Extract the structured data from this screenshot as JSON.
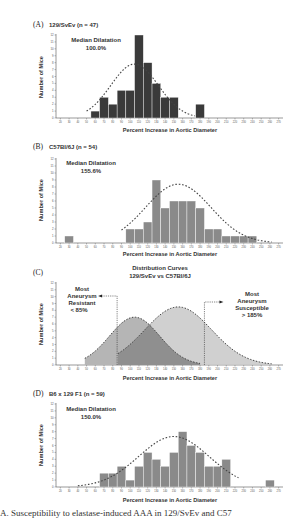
{
  "figure": {
    "x_ticks": [
      20,
      30,
      40,
      50,
      60,
      70,
      80,
      90,
      100,
      110,
      120,
      130,
      140,
      150,
      160,
      170,
      180,
      190,
      200,
      210,
      220,
      230,
      240,
      250,
      260,
      270
    ],
    "y_ticks": [
      0,
      1,
      2,
      3,
      4,
      5,
      6,
      7,
      8,
      9,
      10,
      11,
      12
    ],
    "caption": "A. Susceptibility to elastase-induced AAA in 129/SvEv and C57"
  },
  "panels": [
    {
      "label": "(A)",
      "title": "129/SvEv (n = 47)",
      "annotation_line1": "Median Dilatation",
      "annotation_line2": "100.0%",
      "xlabel": "Percent Increase in Aortic Diameter",
      "ylabel": "Number of Mice"
    },
    {
      "label": "(B)",
      "title": "C57Bl/6J (n = 54)",
      "annotation_line1": "Median Dilatation",
      "annotation_line2": "155.6%",
      "xlabel": "Percent Increase in Aortic Diameter",
      "ylabel": "Number of Mice"
    },
    {
      "label": "(C)",
      "title_line1": "Distribution Curves",
      "title_line2": "129/SvEv vs C57Bl/6J",
      "left_note": [
        "Most",
        "Aneurysm",
        "Resistant",
        "< 85%"
      ],
      "right_note": [
        "Most",
        "Aneurysm",
        "Susceptible",
        "> 185%"
      ],
      "xlabel": "Percent Increase in Aortic Diameter",
      "ylabel": "Number of Mice"
    },
    {
      "label": "(D)",
      "title": "B6 x 129 F1 (n = 59)",
      "annotation_line1": "Median Dilatation",
      "annotation_line2": "150.0%",
      "xlabel": "Percent Increase in Aortic Diameter",
      "ylabel": "Number of Mice"
    }
  ],
  "colors": {
    "bar_dark": "#3a3a3a",
    "bar_gray": "#8a8a8a",
    "curve_129": "#b5b5b5",
    "curve_b6": "#c8c8c8",
    "overlap": "#8f8f8f",
    "dashed": "#444444"
  },
  "chart_data": [
    {
      "type": "bar",
      "title": "(A) 129/SvEv (n = 47)",
      "annotation": "Median Dilatation 100.0%",
      "xlabel": "Percent Increase in Aortic Diameter",
      "ylabel": "Number of Mice",
      "ylim": [
        0,
        12
      ],
      "xlim": [
        20,
        270
      ],
      "categories": [
        60,
        70,
        80,
        90,
        100,
        110,
        120,
        130,
        140,
        150,
        180
      ],
      "values": [
        1,
        3,
        2,
        4,
        4,
        12,
        8,
        5,
        3,
        3,
        2
      ],
      "fit_curve": {
        "type": "normal",
        "peak_x": 105,
        "peak_y": 7.8,
        "x_range": [
          50,
          175
        ]
      }
    },
    {
      "type": "bar",
      "title": "(B) C57Bl/6J (n = 54)",
      "annotation": "Median Dilatation 155.6%",
      "xlabel": "Percent Increase in Aortic Diameter",
      "ylabel": "Number of Mice",
      "ylim": [
        0,
        12
      ],
      "xlim": [
        20,
        270
      ],
      "categories": [
        30,
        100,
        110,
        120,
        130,
        140,
        150,
        160,
        170,
        180,
        190,
        200,
        210,
        220,
        230,
        240
      ],
      "values": [
        1,
        2,
        2,
        3,
        9,
        5,
        6,
        6,
        6,
        5,
        2,
        2,
        1,
        1,
        1,
        1
      ],
      "fit_curve": {
        "type": "normal",
        "peak_x": 155,
        "peak_y": 8.4,
        "x_range": [
          90,
          262
        ]
      }
    },
    {
      "type": "area",
      "title": "(C) Distribution Curves 129/SvEv vs C57Bl/6J",
      "xlabel": "Percent Increase in Aortic Diameter",
      "ylabel": "Number of Mice",
      "ylim": [
        0,
        12
      ],
      "xlim": [
        20,
        270
      ],
      "series": [
        {
          "name": "129/SvEv",
          "peak_x": 105,
          "peak_y": 7.0,
          "x_range": [
            48,
            180
          ]
        },
        {
          "name": "C57Bl/6J",
          "peak_x": 155,
          "peak_y": 8.5,
          "x_range": [
            86,
            262
          ]
        }
      ],
      "annotations": [
        {
          "text": "Most Aneurysm Resistant < 85%",
          "x": 85
        },
        {
          "text": "Most Aneurysm Susceptible > 185%",
          "x": 185
        }
      ]
    },
    {
      "type": "bar",
      "title": "(D) B6 x 129 F1 (n = 59)",
      "annotation": "Median Dilatation 150.0%",
      "xlabel": "Percent Increase in Aortic Diameter",
      "ylabel": "Number of Mice",
      "ylim": [
        0,
        12
      ],
      "xlim": [
        20,
        270
      ],
      "categories": [
        70,
        80,
        90,
        100,
        110,
        120,
        130,
        140,
        150,
        160,
        170,
        180,
        190,
        200,
        210,
        260
      ],
      "values": [
        2,
        2,
        3,
        1,
        3,
        5,
        4,
        3,
        5,
        8,
        6,
        5,
        3,
        3,
        4,
        1
      ],
      "fit_curve": {
        "type": "normal",
        "peak_x": 150,
        "peak_y": 7.3,
        "x_range": [
          40,
          225
        ]
      }
    }
  ]
}
